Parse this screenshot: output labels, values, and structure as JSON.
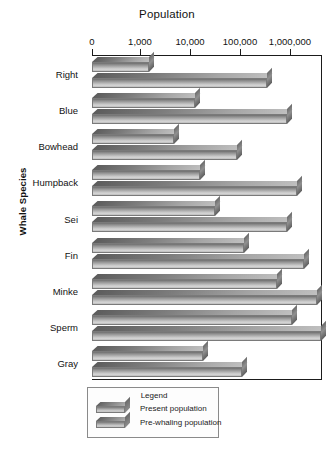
{
  "chart_data": {
    "type": "bar",
    "orientation": "horizontal",
    "title": "Population",
    "xlabel": "Population",
    "ylabel": "Whale Species",
    "xscale": "log",
    "grid": false,
    "legend_position": "bottom",
    "legend_title": "Legend",
    "xticks": [
      {
        "label": "0",
        "value": 0,
        "px": 92
      },
      {
        "label": "1,000",
        "value": 1000,
        "px": 140
      },
      {
        "label": "10,000",
        "value": 10000,
        "px": 190
      },
      {
        "label": "100,000",
        "value": 100000,
        "px": 240
      },
      {
        "label": "1,000,000",
        "value": 1000000,
        "px": 290
      }
    ],
    "categories": [
      "Right",
      "Blue",
      "Bowhead",
      "Humpback",
      "Sei",
      "Fin",
      "Minke",
      "Sperm",
      "Gray"
    ],
    "series": [
      {
        "name": "Present population",
        "values": [
          3000,
          12000,
          7500,
          14000,
          30000,
          80000,
          300000,
          600000,
          22000
        ]
      },
      {
        "name": "Pre-whaling population",
        "values": [
          150000,
          250000,
          40000,
          350000,
          250000,
          450000,
          700000,
          1500000,
          45000
        ]
      }
    ],
    "bar_pixel_lengths": {
      "present": [
        62,
        108,
        87,
        113,
        128,
        157,
        190,
        205,
        116
      ],
      "prewhaling": [
        180,
        200,
        150,
        210,
        200,
        217,
        230,
        234,
        155
      ]
    }
  },
  "axis": {
    "y_caption": "Whale Species"
  },
  "legend": {
    "title": "Legend",
    "items": [
      {
        "label": "Present population"
      },
      {
        "label": "Pre-whaling population"
      }
    ]
  },
  "colors": {
    "bar_light": "#d6d6d6",
    "bar_mid": "#9a9a9a",
    "bar_dark": "#5c5c5c",
    "axis": "#1b1b1b",
    "background": "#ffffff"
  }
}
